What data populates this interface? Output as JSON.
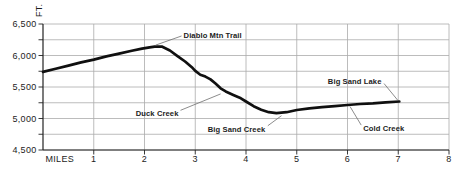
{
  "chart_data": {
    "type": "line",
    "xlabel": "MILES",
    "ylabel": "FT.",
    "xlim": [
      0,
      8
    ],
    "ylim": [
      4500,
      6500
    ],
    "grid": true,
    "x_ticks": [
      1,
      2,
      3,
      4,
      5,
      6,
      7,
      8
    ],
    "y_ticks": [
      {
        "value": 6500,
        "label": "6,500"
      },
      {
        "value": 6000,
        "label": "6,000"
      },
      {
        "value": 5500,
        "label": "5,500"
      },
      {
        "value": 5000,
        "label": "5,000"
      },
      {
        "value": 4500,
        "label": "4,500"
      }
    ],
    "y_minor_ticks": [
      6250,
      5750,
      5250,
      4750
    ],
    "series": [
      {
        "name": "trail-elevation-profile",
        "points": [
          [
            0,
            5740
          ],
          [
            0.25,
            5790
          ],
          [
            0.5,
            5840
          ],
          [
            0.75,
            5890
          ],
          [
            1,
            5935
          ],
          [
            1.25,
            5985
          ],
          [
            1.5,
            6030
          ],
          [
            1.75,
            6075
          ],
          [
            1.95,
            6110
          ],
          [
            2.1,
            6130
          ],
          [
            2.2,
            6140
          ],
          [
            2.35,
            6140
          ],
          [
            2.5,
            6080
          ],
          [
            2.65,
            5990
          ],
          [
            2.8,
            5905
          ],
          [
            2.95,
            5800
          ],
          [
            3.0,
            5755
          ],
          [
            3.1,
            5695
          ],
          [
            3.2,
            5665
          ],
          [
            3.3,
            5620
          ],
          [
            3.4,
            5555
          ],
          [
            3.5,
            5480
          ],
          [
            3.6,
            5430
          ],
          [
            3.75,
            5375
          ],
          [
            3.9,
            5320
          ],
          [
            4.0,
            5270
          ],
          [
            4.15,
            5195
          ],
          [
            4.3,
            5140
          ],
          [
            4.45,
            5100
          ],
          [
            4.6,
            5085
          ],
          [
            4.8,
            5100
          ],
          [
            5.0,
            5135
          ],
          [
            5.25,
            5160
          ],
          [
            5.5,
            5180
          ],
          [
            5.75,
            5195
          ],
          [
            6.0,
            5215
          ],
          [
            6.25,
            5230
          ],
          [
            6.5,
            5240
          ],
          [
            6.75,
            5255
          ],
          [
            7.02,
            5270
          ]
        ]
      }
    ],
    "annotations": [
      {
        "id": "diablo-mtn-trail",
        "text": "Diablo Mtn Trail",
        "anchor": "start",
        "label_at": [
          2.77,
          6330
        ],
        "leader": [
          [
            2.73,
            6310
          ],
          [
            2.22,
            6165
          ]
        ]
      },
      {
        "id": "duck-creek",
        "text": "Duck Creek",
        "anchor": "end",
        "label_at": [
          2.67,
          5090
        ],
        "leader": [
          [
            2.71,
            5130
          ],
          [
            3.5,
            5390
          ]
        ]
      },
      {
        "id": "big-sand-creek",
        "text": "Big Sand Creek",
        "anchor": "end",
        "label_at": [
          4.38,
          4835
        ],
        "leader": [
          [
            4.43,
            4885
          ],
          [
            4.7,
            5045
          ]
        ]
      },
      {
        "id": "big-sand-lake",
        "text": "Big Sand Lake",
        "anchor": "end",
        "label_at": [
          6.67,
          5595
        ],
        "leader": [
          [
            6.72,
            5555
          ],
          [
            6.99,
            5290
          ]
        ]
      },
      {
        "id": "cold-creek",
        "text": "Cold Creek",
        "anchor": "start",
        "label_at": [
          6.31,
          4845
        ],
        "leader": [
          [
            6.27,
            4895
          ],
          [
            6.05,
            5190
          ]
        ]
      }
    ],
    "colors": {
      "line": "#101010",
      "grid": "#ababab",
      "axis": "#222222",
      "leader": "#6f6f6f",
      "text": "#1c1c1c",
      "background": "#ffffff"
    },
    "legend": "none"
  }
}
